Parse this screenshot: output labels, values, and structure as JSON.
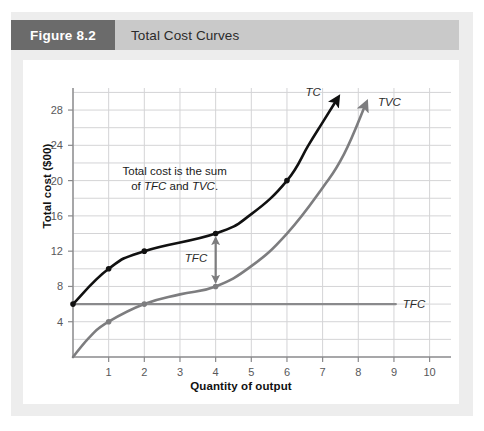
{
  "figure": {
    "number_label": "Figure 8.2",
    "title": "Total Cost Curves"
  },
  "colors": {
    "header_number_bg": "#6b6b6b",
    "header_bar_bg": "#c9c9c9",
    "panel_bg": "#ededed",
    "card_bg": "#ffffff",
    "grid": "#d4d4d6",
    "axis": "#8a8a8c",
    "tc_curve": "#111111",
    "tvc_curve": "#7d7d7f",
    "tfc_line": "#8a8a8c",
    "tick_text": "#58585a"
  },
  "chart_data": {
    "type": "line",
    "title": "Total Cost Curves",
    "xlabel": "Quantity of output",
    "ylabel": "Total cost ($00)",
    "xlim": [
      0,
      10.6
    ],
    "ylim": [
      0,
      30.5
    ],
    "grid": true,
    "legend": "inline-curve-labels",
    "xticks": [
      1,
      2,
      3,
      4,
      5,
      6,
      7,
      8,
      9,
      10
    ],
    "yticks": [
      4,
      8,
      12,
      16,
      20,
      24,
      28
    ],
    "x_gridlines": [
      0,
      1,
      2,
      3,
      4,
      5,
      6,
      7,
      8,
      9,
      10
    ],
    "y_gridlines": [
      2,
      4,
      6,
      8,
      10,
      12,
      14,
      16,
      18,
      20,
      22,
      24,
      26,
      28,
      30
    ],
    "series": [
      {
        "name": "TC",
        "label": "TC",
        "color": "#111111",
        "arrow_end": true,
        "markers_at": [
          [
            0,
            6
          ],
          [
            1,
            10
          ],
          [
            2,
            12
          ],
          [
            4,
            14
          ],
          [
            6,
            20
          ]
        ],
        "points": [
          [
            0,
            6
          ],
          [
            1,
            10
          ],
          [
            2,
            12
          ],
          [
            4,
            14
          ],
          [
            5,
            16.2
          ],
          [
            6,
            20
          ],
          [
            6.6,
            24
          ],
          [
            7.0,
            26.6
          ],
          [
            7.4,
            29.2
          ]
        ]
      },
      {
        "name": "TVC",
        "label": "TVC",
        "color": "#7d7d7f",
        "arrow_end": true,
        "markers_at": [
          [
            1,
            4
          ],
          [
            2,
            6
          ],
          [
            4,
            8
          ]
        ],
        "points": [
          [
            0,
            0
          ],
          [
            0.5,
            2.4
          ],
          [
            1,
            4
          ],
          [
            2,
            6
          ],
          [
            3,
            7.1
          ],
          [
            4,
            8
          ],
          [
            5,
            10.3
          ],
          [
            6,
            14
          ],
          [
            7,
            19.2
          ],
          [
            7.6,
            23
          ],
          [
            8.2,
            28.6
          ]
        ]
      },
      {
        "name": "TFC",
        "label": "TFC",
        "color": "#8a8a8c",
        "arrow_end": false,
        "markers_at": [],
        "points": [
          [
            0,
            6
          ],
          [
            9.05,
            6
          ]
        ]
      }
    ],
    "annotations": [
      {
        "name": "sum-note",
        "lines": [
          [
            {
              "t": "Total cost is the sum",
              "style": "normal"
            }
          ],
          [
            {
              "t": "of ",
              "style": "normal"
            },
            {
              "t": "TFC",
              "style": "italic"
            },
            {
              "t": " and ",
              "style": "normal"
            },
            {
              "t": "TVC",
              "style": "italic"
            },
            {
              "t": ".",
              "style": "normal"
            }
          ]
        ],
        "at": [
          2.85,
          20.6
        ]
      },
      {
        "name": "tfc-gap-arrow",
        "label": "TFC",
        "x": 4,
        "y_from": 8,
        "y_to": 14,
        "label_at": [
          3.45,
          11.2
        ]
      }
    ],
    "curve_labels": [
      {
        "name": "TC",
        "text": "TC",
        "at": [
          6.95,
          30.0
        ]
      },
      {
        "name": "TVC",
        "text": "TVC",
        "at": [
          8.55,
          28.9
        ]
      },
      {
        "name": "TFC",
        "text": "TFC",
        "at": [
          9.25,
          6.0
        ]
      }
    ]
  }
}
